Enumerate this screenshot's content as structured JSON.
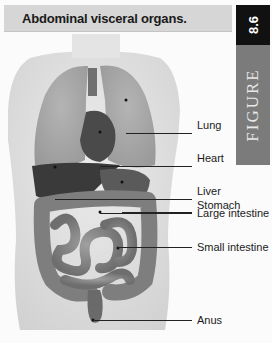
{
  "header": {
    "title": "Abdominal visceral organs.",
    "figure_number": "8.6",
    "figure_word": "FIGURE"
  },
  "colors": {
    "title_bar_bg": "#d6d6d6",
    "figure_number_bg": "#111111",
    "figure_word_bg": "#7b7b7b"
  },
  "illustration": {
    "description": "Anterior view of human torso showing thoracic and abdominal organs"
  },
  "labels": [
    {
      "text": "Lung",
      "y": 125
    },
    {
      "text": "Heart",
      "y": 159
    },
    {
      "text": "Liver",
      "y": 190
    },
    {
      "text": "Stomach",
      "y": 205
    },
    {
      "text": "Large intestine",
      "y": 213
    },
    {
      "text": "Small intestine",
      "y": 247
    },
    {
      "text": "Anus",
      "y": 320
    }
  ]
}
